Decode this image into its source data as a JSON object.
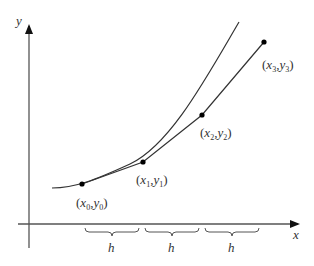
{
  "diagram": {
    "axes": {
      "x_label": "x",
      "y_label": "y",
      "color": "#555555"
    },
    "points": [
      {
        "label_x": "x",
        "label_y": "y",
        "sub": "0",
        "px": 82,
        "py": 184
      },
      {
        "label_x": "x",
        "label_y": "y",
        "sub": "1",
        "px": 143,
        "py": 162
      },
      {
        "label_x": "x",
        "label_y": "y",
        "sub": "2",
        "px": 202,
        "py": 115
      },
      {
        "label_x": "x",
        "label_y": "y",
        "sub": "3",
        "px": 264,
        "py": 42
      }
    ],
    "step_label": "h",
    "intervals": [
      "h",
      "h",
      "h"
    ],
    "curve_color": "#333333",
    "point_color": "#000000"
  }
}
